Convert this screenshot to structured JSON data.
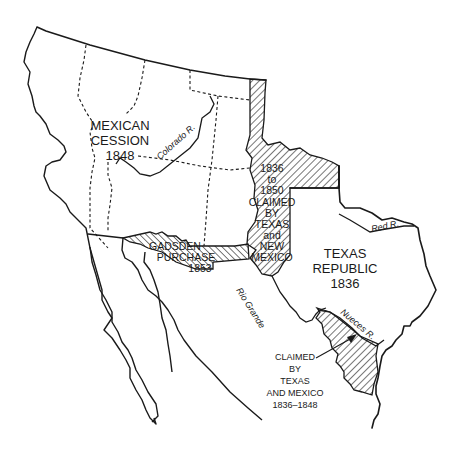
{
  "map": {
    "colors": {
      "ink": "#1a1a1a",
      "paper": "#ffffff"
    },
    "regions": [
      {
        "id": "mexican-cession",
        "lines": [
          "MEXICAN",
          "CESSION",
          "1848"
        ]
      },
      {
        "id": "texas-republic",
        "lines": [
          "TEXAS",
          "REPUBLIC",
          "1836"
        ]
      },
      {
        "id": "gadsden-purchase",
        "lines": [
          "GADSDEN",
          "PURCHASE",
          "1853"
        ]
      },
      {
        "id": "claimed-texas-new-mexico",
        "lines": [
          "1836",
          "to",
          "1850",
          "CLAIMED",
          "BY",
          "TEXAS",
          "and",
          "NEW",
          "MEXICO"
        ]
      },
      {
        "id": "claimed-texas-mexico",
        "lines": [
          "CLAIMED",
          "BY",
          "TEXAS",
          "AND MEXICO",
          "1836–1848"
        ]
      }
    ],
    "rivers": [
      {
        "id": "colorado",
        "label": "Colorado R."
      },
      {
        "id": "red",
        "label": "Red R."
      },
      {
        "id": "rio-grande",
        "label": "Rio Grande"
      },
      {
        "id": "nueces",
        "label": "Nueces R."
      }
    ]
  }
}
